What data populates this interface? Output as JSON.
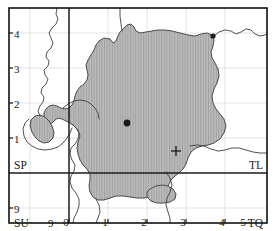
{
  "figure": {
    "kind": "grid-reference-map"
  },
  "colors": {
    "frame": "#111111",
    "major_grid": "#222222",
    "minor_grid": "#d9d9d9",
    "coastline": "#3a3a3a",
    "shade_fill": "#b9b9b9",
    "shade_hatch": "#9a9a9a",
    "shade_outline": "#4a4a4a",
    "marker_dot": "#1c1c1c",
    "marker_cross": "#1c1c1c",
    "background": "#ffffff"
  },
  "axes": {
    "x_labels": [
      "0",
      "1",
      "2",
      "3",
      "4",
      "5"
    ],
    "y_labels": [
      "4",
      "3",
      "2",
      "1"
    ],
    "y_labels_lower": [
      "9"
    ]
  },
  "grid_squares": [
    {
      "code": "SP",
      "corner": "top-left"
    },
    {
      "code": "TL",
      "corner": "top-right"
    },
    {
      "code": "SU",
      "corner": "bottom-left"
    },
    {
      "code": "TQ",
      "corner": "bottom-right"
    }
  ],
  "extra_labels": {
    "su_row_tick": "9"
  },
  "markers": [
    {
      "type": "filled-dot",
      "x": 127,
      "y": 123
    },
    {
      "type": "cross",
      "x": 176,
      "y": 151
    },
    {
      "type": "filled-dot",
      "x": 213,
      "y": 36
    }
  ]
}
